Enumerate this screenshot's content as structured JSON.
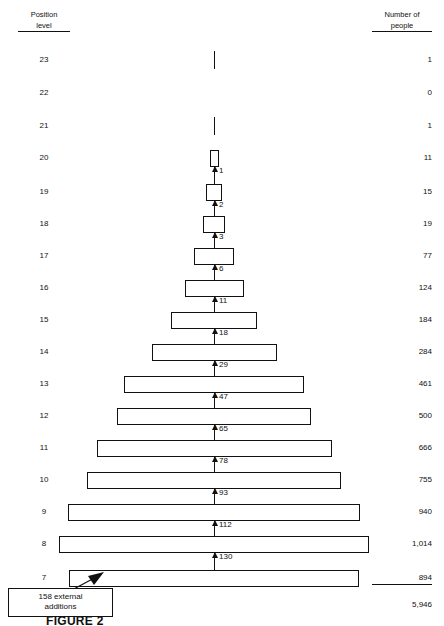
{
  "headers": {
    "left_line1": "Position",
    "left_line2": "level",
    "right_line1": "Number of",
    "right_line2": "people"
  },
  "figure": {
    "caption": "FIGURE 2"
  },
  "callout": {
    "line1": "158 external",
    "line2": "additions"
  },
  "totals": {
    "grand_total": "5,946"
  },
  "colors": {
    "ink": "#111111",
    "paper": "#ffffff"
  },
  "chart_data": {
    "type": "bar",
    "xlabel": "Number of people",
    "ylabel": "Position level",
    "orientation": "horizontal-centered",
    "categories": [
      "23",
      "22",
      "21",
      "20",
      "19",
      "18",
      "17",
      "16",
      "15",
      "14",
      "13",
      "12",
      "11",
      "10",
      "9",
      "8",
      "7"
    ],
    "values": [
      1,
      0,
      1,
      11,
      15,
      19,
      77,
      124,
      184,
      284,
      461,
      500,
      666,
      755,
      940,
      1014,
      894
    ],
    "value_labels": [
      "1",
      "0",
      "1",
      "11",
      "15",
      "19",
      "77",
      "124",
      "184",
      "284",
      "461",
      "500",
      "666",
      "755",
      "940",
      "1,014",
      "894"
    ],
    "promotions_between_levels": [
      {
        "from_level": "19",
        "to_level": "20",
        "count": 1
      },
      {
        "from_level": "18",
        "to_level": "19",
        "count": 2
      },
      {
        "from_level": "17",
        "to_level": "18",
        "count": 3
      },
      {
        "from_level": "16",
        "to_level": "17",
        "count": 6
      },
      {
        "from_level": "15",
        "to_level": "16",
        "count": 11
      },
      {
        "from_level": "14",
        "to_level": "15",
        "count": 18
      },
      {
        "from_level": "13",
        "to_level": "14",
        "count": 29
      },
      {
        "from_level": "12",
        "to_level": "13",
        "count": 47
      },
      {
        "from_level": "11",
        "to_level": "12",
        "count": 65
      },
      {
        "from_level": "10",
        "to_level": "11",
        "count": 78
      },
      {
        "from_level": "9",
        "to_level": "10",
        "count": 93
      },
      {
        "from_level": "8",
        "to_level": "9",
        "count": 112
      },
      {
        "from_level": "7",
        "to_level": "8",
        "count": 130
      }
    ],
    "external_additions": 158,
    "total": 5946,
    "grid": false,
    "legend": false
  },
  "rows": [
    {
      "level": "23",
      "count": "1",
      "y": 60,
      "width": 2,
      "height": 18,
      "tick": true,
      "arrow": null
    },
    {
      "level": "22",
      "count": "0",
      "y": 93,
      "width": 0,
      "height": 0,
      "tick": false,
      "arrow": null
    },
    {
      "level": "21",
      "count": "1",
      "y": 126,
      "width": 2,
      "height": 18,
      "tick": true,
      "arrow": null
    },
    {
      "level": "20",
      "count": "11",
      "y": 158,
      "width": 9,
      "height": 17,
      "tick": false,
      "arrow": "1"
    },
    {
      "level": "19",
      "count": "15",
      "y": 192,
      "width": 16,
      "height": 17,
      "tick": false,
      "arrow": "2"
    },
    {
      "level": "18",
      "count": "19",
      "y": 224,
      "width": 22,
      "height": 17,
      "tick": false,
      "arrow": "3"
    },
    {
      "level": "17",
      "count": "77",
      "y": 256,
      "width": 40,
      "height": 17,
      "tick": false,
      "arrow": "6"
    },
    {
      "level": "16",
      "count": "124",
      "y": 288,
      "width": 59,
      "height": 17,
      "tick": false,
      "arrow": "11"
    },
    {
      "level": "15",
      "count": "184",
      "y": 320,
      "width": 86,
      "height": 17,
      "tick": false,
      "arrow": "18"
    },
    {
      "level": "14",
      "count": "284",
      "y": 352,
      "width": 125,
      "height": 17,
      "tick": false,
      "arrow": "29"
    },
    {
      "level": "13",
      "count": "461",
      "y": 384,
      "width": 180,
      "height": 17,
      "tick": false,
      "arrow": "47"
    },
    {
      "level": "12",
      "count": "500",
      "y": 416,
      "width": 194,
      "height": 17,
      "tick": false,
      "arrow": "65"
    },
    {
      "level": "11",
      "count": "666",
      "y": 448,
      "width": 235,
      "height": 17,
      "tick": false,
      "arrow": "78"
    },
    {
      "level": "10",
      "count": "755",
      "y": 480,
      "width": 254,
      "height": 17,
      "tick": false,
      "arrow": "93"
    },
    {
      "level": "9",
      "count": "940",
      "y": 512,
      "width": 292,
      "height": 17,
      "tick": false,
      "arrow": "112"
    },
    {
      "level": "8",
      "count": "1,014",
      "y": 544,
      "width": 310,
      "height": 17,
      "tick": false,
      "arrow": "130"
    },
    {
      "level": "7",
      "count": "894",
      "y": 578,
      "width": 290,
      "height": 17,
      "tick": false,
      "arrow": null,
      "ruled": true
    }
  ]
}
